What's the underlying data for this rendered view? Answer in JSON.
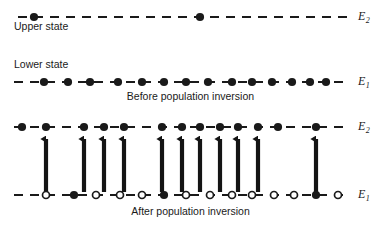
{
  "figure": {
    "width": 382,
    "height": 225,
    "background": "#ffffff",
    "ink_color": "#1a1a1a"
  },
  "labels": {
    "upper_state": "Upper state",
    "lower_state": "Lower state",
    "caption_before": "Before population inversion",
    "caption_after": "After population inversion",
    "e2_top": "E",
    "e2_top_sub": "2",
    "e1_middle": "E",
    "e1_middle_sub": "1",
    "e2_bottom": "E",
    "e2_bottom_sub": "2",
    "e1_bottom": "E",
    "e1_bottom_sub": "1"
  },
  "chart_data": {
    "type": "diagram",
    "levels": [
      {
        "id": "level-e2-before",
        "label": "E2",
        "name": "Upper state",
        "y": 17,
        "x_start": 18,
        "x_end": 348,
        "line_style": "dashed",
        "panel": "before",
        "population_count": 2,
        "marker_type": "filled",
        "markers": [
          {
            "x": 34,
            "filled": true
          },
          {
            "x": 200,
            "filled": true
          }
        ]
      },
      {
        "id": "level-e1-before",
        "label": "E1",
        "name": "Lower state",
        "y": 82,
        "x_start": 14,
        "x_end": 348,
        "line_style": "dashed",
        "panel": "before",
        "population_count": 14,
        "marker_type": "filled",
        "markers": [
          {
            "x": 44,
            "filled": true
          },
          {
            "x": 68,
            "filled": true
          },
          {
            "x": 90,
            "filled": true
          },
          {
            "x": 118,
            "filled": true
          },
          {
            "x": 142,
            "filled": true
          },
          {
            "x": 164,
            "filled": true
          },
          {
            "x": 186,
            "filled": true
          },
          {
            "x": 208,
            "filled": true
          },
          {
            "x": 232,
            "filled": true
          },
          {
            "x": 252,
            "filled": true
          },
          {
            "x": 272,
            "filled": true
          },
          {
            "x": 292,
            "filled": true
          },
          {
            "x": 310,
            "filled": true
          },
          {
            "x": 326,
            "filled": true
          }
        ]
      },
      {
        "id": "level-e2-after",
        "label": "E2",
        "name": "Upper state",
        "y": 127,
        "x_start": 14,
        "x_end": 348,
        "line_style": "dashed",
        "panel": "after",
        "population_count": 14,
        "marker_type": "filled",
        "markers": [
          {
            "x": 22,
            "filled": true
          },
          {
            "x": 46,
            "filled": true
          },
          {
            "x": 84,
            "filled": true
          },
          {
            "x": 104,
            "filled": true
          },
          {
            "x": 124,
            "filled": true
          },
          {
            "x": 162,
            "filled": true
          },
          {
            "x": 182,
            "filled": true
          },
          {
            "x": 200,
            "filled": true
          },
          {
            "x": 220,
            "filled": true
          },
          {
            "x": 238,
            "filled": true
          },
          {
            "x": 258,
            "filled": true
          },
          {
            "x": 278,
            "filled": true
          },
          {
            "x": 316,
            "filled": true
          }
        ]
      },
      {
        "id": "level-e1-after",
        "label": "E1",
        "name": "Lower state",
        "y": 195,
        "x_start": 14,
        "x_end": 348,
        "line_style": "dashed",
        "panel": "after",
        "population_count": 12,
        "marker_type": "mixed",
        "markers": [
          {
            "x": 46,
            "filled": false
          },
          {
            "x": 74,
            "filled": true
          },
          {
            "x": 96,
            "filled": false
          },
          {
            "x": 120,
            "filled": false
          },
          {
            "x": 142,
            "filled": false
          },
          {
            "x": 164,
            "filled": true
          },
          {
            "x": 186,
            "filled": false
          },
          {
            "x": 210,
            "filled": false
          },
          {
            "x": 232,
            "filled": false
          },
          {
            "x": 252,
            "filled": false
          },
          {
            "x": 274,
            "filled": false
          },
          {
            "x": 294,
            "filled": false
          },
          {
            "x": 316,
            "filled": true
          },
          {
            "x": 338,
            "filled": false
          }
        ]
      }
    ],
    "pump_arrows": {
      "direction": "up",
      "from_level": "level-e1-after",
      "to_level": "level-e2-after",
      "y_tail": 192,
      "y_head": 133,
      "count": 11,
      "x_positions": [
        46,
        84,
        104,
        124,
        162,
        182,
        200,
        220,
        238,
        258,
        316
      ]
    },
    "annotations": [
      {
        "text": "Upper state",
        "x": 14,
        "y": 27,
        "anchor": "start"
      },
      {
        "text": "Lower state",
        "x": 14,
        "y": 64,
        "anchor": "start"
      },
      {
        "text": "Before population inversion",
        "x": 190,
        "y": 96,
        "anchor": "middle"
      },
      {
        "text": "After population inversion",
        "x": 190,
        "y": 211,
        "anchor": "middle"
      }
    ],
    "legend": {
      "filled_circle": "atom occupying this energy level",
      "open_circle": "vacancy / depopulated state"
    }
  }
}
